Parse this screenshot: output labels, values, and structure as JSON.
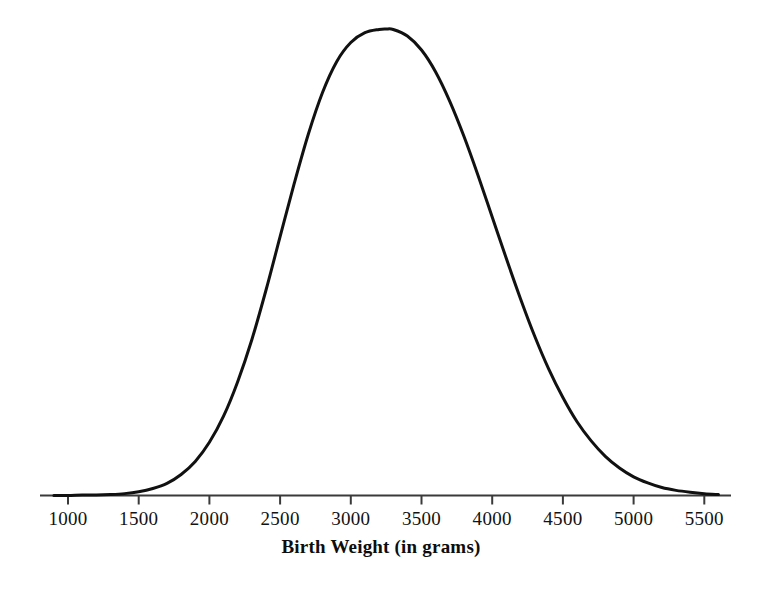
{
  "figure": {
    "background_color": "#ffffff",
    "curve_color": "#111111",
    "axis_color": "#3a3a3a"
  },
  "axis": {
    "title": "Birth Weight (in grams)",
    "tick_labels": [
      "1000",
      "1500",
      "2000",
      "2500",
      "3000",
      "3500",
      "4000",
      "4500",
      "5000",
      "5500"
    ]
  },
  "chart_data": {
    "type": "line",
    "title": "",
    "subtitle": "",
    "xlabel": "Birth Weight (in grams)",
    "ylabel": "",
    "grid": false,
    "legend": "none",
    "distribution": "normal",
    "mean": 3250,
    "std": 545,
    "xlim": [
      800,
      5750
    ],
    "ylim": [
      0,
      1
    ],
    "xticks": [
      1000,
      1500,
      2000,
      2500,
      3000,
      3500,
      4000,
      4500,
      5000,
      5500
    ],
    "xticklabels": [
      "1000",
      "1500",
      "2000",
      "2500",
      "3000",
      "3500",
      "4000",
      "4500",
      "5000",
      "5500"
    ],
    "yticks": [],
    "yticklabels": [],
    "series": [
      {
        "name": "Birth weight distribution",
        "x": [
          900,
          1000,
          1100,
          1200,
          1300,
          1400,
          1500,
          1600,
          1700,
          1800,
          1900,
          2000,
          2100,
          2200,
          2300,
          2400,
          2500,
          2600,
          2700,
          2800,
          2900,
          3000,
          3100,
          3200,
          3250,
          3300,
          3400,
          3500,
          3600,
          3700,
          3800,
          3900,
          4000,
          4100,
          4200,
          4300,
          4400,
          4500,
          4600,
          4700,
          4800,
          4900,
          5000,
          5100,
          5200,
          5300,
          5400,
          5500,
          5600
        ],
        "y": [
          0.0,
          0.0,
          0.001,
          0.001,
          0.002,
          0.004,
          0.008,
          0.015,
          0.026,
          0.045,
          0.073,
          0.114,
          0.17,
          0.244,
          0.334,
          0.44,
          0.555,
          0.669,
          0.775,
          0.864,
          0.93,
          0.971,
          0.992,
          0.999,
          1.0,
          0.999,
          0.985,
          0.955,
          0.908,
          0.845,
          0.77,
          0.686,
          0.597,
          0.508,
          0.422,
          0.342,
          0.271,
          0.21,
          0.158,
          0.117,
          0.084,
          0.059,
          0.04,
          0.027,
          0.017,
          0.011,
          0.007,
          0.004,
          0.002
        ]
      }
    ]
  }
}
